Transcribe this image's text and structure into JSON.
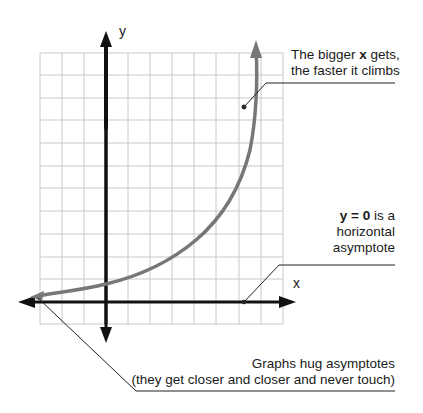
{
  "diagram": {
    "type": "exponential-growth-graph",
    "axes": {
      "x_label": "x",
      "y_label": "y"
    },
    "grid": {
      "columns": 11,
      "rows": 12,
      "color": "#c8c8c8"
    },
    "curve_color": "#777777",
    "axis_color": "#111111"
  },
  "annotations": {
    "growth": {
      "line1_pre": "The bigger ",
      "line1_bold": "x",
      "line1_post": " gets,",
      "line2": "the faster it climbs"
    },
    "asymptote": {
      "line1_bold": "y = 0",
      "line1_post": " is a",
      "line2": "horizontal",
      "line3": "asymptote"
    },
    "hug": {
      "line1": "Graphs hug asymptotes",
      "line2": "(they get closer and closer and never touch)"
    }
  }
}
